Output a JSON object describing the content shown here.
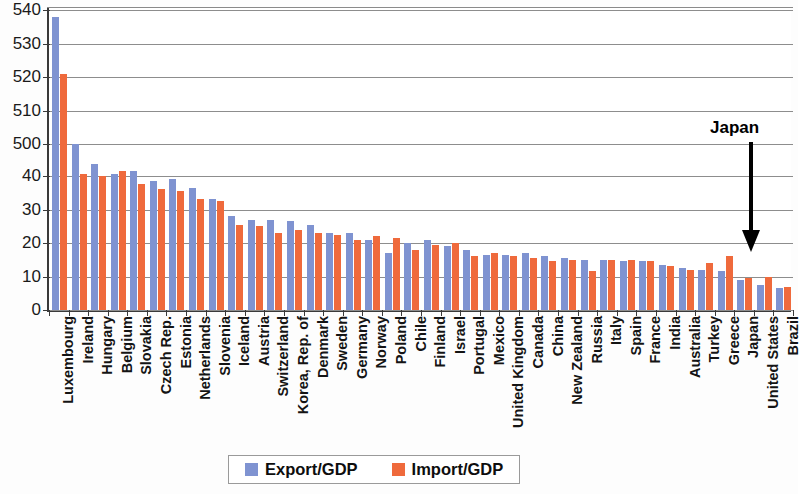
{
  "chart_data": {
    "type": "bar",
    "title": "",
    "xlabel": "",
    "ylabel": "",
    "grid": true,
    "legend_position": "bottom",
    "axis_note": "broken y-axis: 0-40 lower segment, 500-540 upper segment",
    "y_ticks": [
      {
        "label": "540",
        "value": 540
      },
      {
        "label": "530",
        "value": 530
      },
      {
        "label": "520",
        "value": 520
      },
      {
        "label": "510",
        "value": 510
      },
      {
        "label": "500",
        "value": 500
      },
      {
        "label": "40",
        "value": 40
      },
      {
        "label": "30",
        "value": 30
      },
      {
        "label": "20",
        "value": 20
      },
      {
        "label": "10",
        "value": 10
      },
      {
        "label": "0",
        "value": 0
      }
    ],
    "categories": [
      "Luxembourg",
      "Ireland",
      "Hungary",
      "Belgium",
      "Slovakia",
      "Czech Rep.",
      "Estonia",
      "Netherlands",
      "Slovenia",
      "Iceland",
      "Austria",
      "Switzerland",
      "Korea, Rep. of",
      "Denmark",
      "Sweden",
      "Germany",
      "Norway",
      "Poland",
      "Chile",
      "Finland",
      "Israel",
      "Portugal",
      "Mexico",
      "United Kingdom",
      "Canada",
      "China",
      "New Zealand",
      "Russia",
      "Italy",
      "Spain",
      "France",
      "India",
      "Australia",
      "Turkey",
      "Greece",
      "Japan",
      "United States",
      "Brazil"
    ],
    "series": [
      {
        "name": "Export/GDP",
        "color": "#7f93d1",
        "values": [
          538,
          500,
          43.5,
          40.5,
          41.5,
          38.5,
          39,
          36.5,
          33,
          28,
          27,
          27,
          26.5,
          25.5,
          23,
          23,
          21,
          17,
          20,
          21,
          19,
          18,
          16.5,
          16.5,
          17,
          16,
          15.5,
          15,
          15,
          14.5,
          14.5,
          13.5,
          12.5,
          12,
          11.5,
          9,
          7.5,
          6.5
        ]
      },
      {
        "name": "Import/GDP",
        "color": "#ef6a3c",
        "values": [
          521,
          40.5,
          40,
          41.5,
          37.5,
          36,
          35.5,
          33,
          32.5,
          25.5,
          25,
          23,
          24,
          23,
          22.5,
          21,
          22,
          21.5,
          18,
          19.5,
          20,
          16,
          17,
          16,
          15.5,
          14.5,
          15,
          11.5,
          15,
          15,
          14.5,
          13,
          12,
          14,
          16,
          9.5,
          10,
          7
        ]
      }
    ]
  },
  "annotation": {
    "label": "Japan",
    "arrow": "down-arrow-icon"
  },
  "legend": {
    "items": [
      {
        "label": "Export/GDP",
        "color": "#7f93d1"
      },
      {
        "label": "Import/GDP",
        "color": "#ef6a3c"
      }
    ]
  }
}
